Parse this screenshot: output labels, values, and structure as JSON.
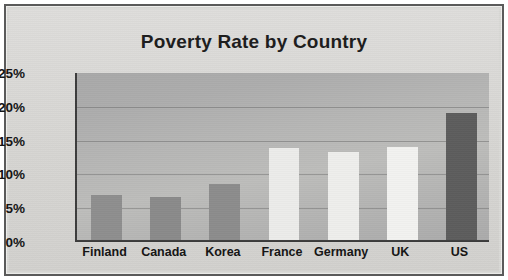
{
  "chart_data": {
    "type": "bar",
    "title": "Poverty Rate by Country",
    "xlabel": "",
    "ylabel": "",
    "categories": [
      "Finland",
      "Canada",
      "Korea",
      "France",
      "Germany",
      "UK",
      "US"
    ],
    "values": [
      6.7,
      6.4,
      8.3,
      13.6,
      13.0,
      13.8,
      18.8
    ],
    "value_labels": [
      "",
      "",
      "",
      "",
      "",
      "",
      ""
    ],
    "ylim": [
      0,
      25
    ],
    "ytick_values": [
      0,
      5,
      10,
      15,
      20,
      25
    ],
    "ytick_labels": [
      "0%",
      "5%",
      "10%",
      "15%",
      "20%",
      "25%"
    ],
    "grid": true,
    "legend": false,
    "legend_position": "none",
    "bar_colors": [
      "#8e8e8e",
      "#8a8a8a",
      "#8c8c8c",
      "#ececea",
      "#eeeeec",
      "#f2f2f0",
      "#5d5d5d"
    ],
    "plot_background": "#b2b2b1",
    "frame_color": "#5a5a5a",
    "text_color": "#141414"
  },
  "figure": {
    "background": "#d9d9d6"
  }
}
